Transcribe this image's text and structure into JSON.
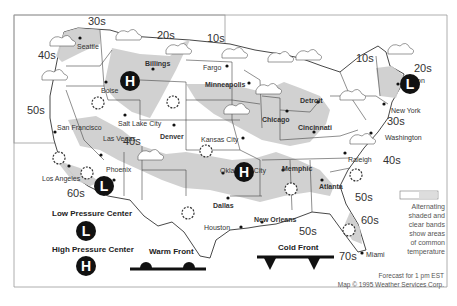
{
  "map": {
    "title": "U.S. Weather Forecast Map",
    "temperature_bands": [
      {
        "label": "30s",
        "x": 88,
        "y": 16
      },
      {
        "label": "40s",
        "x": 38,
        "y": 50
      },
      {
        "label": "20s",
        "x": 157,
        "y": 30
      },
      {
        "label": "10s",
        "x": 207,
        "y": 33
      },
      {
        "label": "10s",
        "x": 356,
        "y": 53
      },
      {
        "label": "20s",
        "x": 414,
        "y": 63
      },
      {
        "label": "50s",
        "x": 27,
        "y": 105
      },
      {
        "label": "40s",
        "x": 123,
        "y": 136
      },
      {
        "label": "30s",
        "x": 387,
        "y": 116
      },
      {
        "label": "60s",
        "x": 67,
        "y": 188
      },
      {
        "label": "40s",
        "x": 383,
        "y": 155
      },
      {
        "label": "50s",
        "x": 355,
        "y": 192
      },
      {
        "label": "60s",
        "x": 361,
        "y": 215
      },
      {
        "label": "50s",
        "x": 299,
        "y": 226
      },
      {
        "label": "70s",
        "x": 339,
        "y": 251
      }
    ],
    "cities": [
      {
        "name": "Seattle",
        "x": 77,
        "y": 43
      },
      {
        "name": "Billings",
        "x": 145,
        "y": 60
      },
      {
        "name": "Fargo",
        "x": 203,
        "y": 64
      },
      {
        "name": "Boise",
        "x": 101,
        "y": 87
      },
      {
        "name": "Minneapolis",
        "x": 205,
        "y": 81
      },
      {
        "name": "Salt Lake City",
        "x": 118,
        "y": 120
      },
      {
        "name": "Denver",
        "x": 160,
        "y": 133
      },
      {
        "name": "San Francisco",
        "x": 57,
        "y": 124
      },
      {
        "name": "Las Vegas",
        "x": 103,
        "y": 135
      },
      {
        "name": "Kansas City",
        "x": 201,
        "y": 136
      },
      {
        "name": "Chicago",
        "x": 262,
        "y": 116
      },
      {
        "name": "Detroit",
        "x": 300,
        "y": 97
      },
      {
        "name": "Cincinnati",
        "x": 298,
        "y": 124
      },
      {
        "name": "Boston",
        "x": 403,
        "y": 77
      },
      {
        "name": "New York",
        "x": 391,
        "y": 107
      },
      {
        "name": "Washington",
        "x": 385,
        "y": 134
      },
      {
        "name": "Phoenix",
        "x": 106,
        "y": 166
      },
      {
        "name": "Los Angeles",
        "x": 42,
        "y": 175
      },
      {
        "name": "Oklahoma City",
        "x": 220,
        "y": 167
      },
      {
        "name": "Memphic",
        "x": 282,
        "y": 165
      },
      {
        "name": "Raleigh",
        "x": 348,
        "y": 156
      },
      {
        "name": "Atlanta",
        "x": 319,
        "y": 183
      },
      {
        "name": "Dallas",
        "x": 213,
        "y": 202
      },
      {
        "name": "New Orleans",
        "x": 254,
        "y": 216
      },
      {
        "name": "Houston",
        "x": 204,
        "y": 224
      },
      {
        "name": "Miami",
        "x": 366,
        "y": 251
      }
    ],
    "pressure_centers": [
      {
        "type": "H",
        "x": 130,
        "y": 81
      },
      {
        "type": "H",
        "x": 244,
        "y": 172
      },
      {
        "type": "L",
        "x": 104,
        "y": 186
      },
      {
        "type": "L",
        "x": 410,
        "y": 84
      }
    ]
  },
  "legend": {
    "low_pressure_label": "Low Pressure Center",
    "low_pressure_symbol": "L",
    "high_pressure_label": "High Pressure Center",
    "high_pressure_symbol": "H",
    "warm_front_label": "Warm Front",
    "cold_front_label": "Cold Front",
    "band_note_lines": [
      "Alternating",
      "shaded and",
      "clear bands",
      "show areas",
      "of common",
      "temperature"
    ]
  },
  "footer": {
    "forecast": "Forecast for 1 pm EST",
    "credit": "Map © 1995 Weather Services Corp."
  },
  "colors": {
    "shade": "#cfcfcf",
    "dark_shade": "#a9a9a9",
    "symbol": "#111111",
    "line": "#333333"
  }
}
